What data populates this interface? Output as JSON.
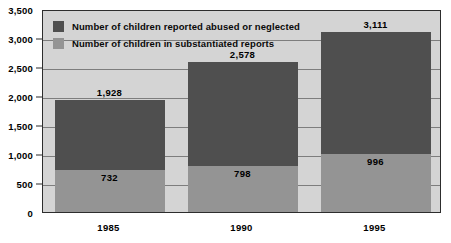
{
  "chart_data": {
    "type": "bar",
    "subtype": "stacked-bar",
    "title": "",
    "xlabel": "",
    "ylabel": "",
    "categories": [
      "1985",
      "1990",
      "1995"
    ],
    "series": [
      {
        "name": "Number of children reported abused or neglected",
        "color": "#4f4f4f",
        "values": [
          1928,
          2578,
          3111
        ],
        "labels": [
          "1,928",
          "2,578",
          "3,111"
        ]
      },
      {
        "name": "Number of children in substantiated reports",
        "color": "#949494",
        "values": [
          732,
          798,
          996
        ],
        "labels": [
          "732",
          "798",
          "996"
        ]
      }
    ],
    "ylim": [
      0,
      3500
    ],
    "ytick_values": [
      0,
      500,
      1000,
      1500,
      2000,
      2500,
      3000,
      3500
    ],
    "ytick_labels": [
      "0",
      "500",
      "1,000",
      "1,500",
      "2,000",
      "2,500",
      "3,000",
      "3,500"
    ],
    "grid": true,
    "legend_position": "top-left",
    "plot_background": "#d4d4d4"
  },
  "legend": {
    "items": [
      {
        "label": "Number of children reported abused or neglected",
        "swatch": "dark"
      },
      {
        "label": "Number of children in substantiated reports",
        "swatch": "light"
      }
    ]
  }
}
